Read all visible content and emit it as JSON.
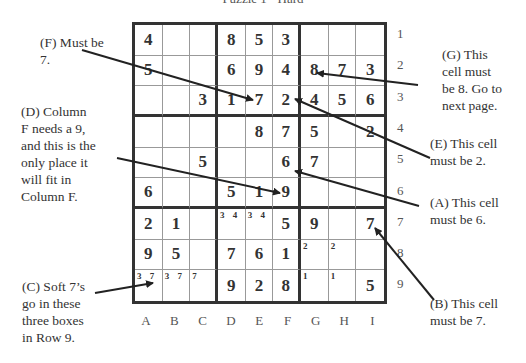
{
  "title": "Puzzle 1 - Hard",
  "grid": {
    "columns": [
      "A",
      "B",
      "C",
      "D",
      "E",
      "F",
      "G",
      "H",
      "I"
    ],
    "rows": [
      "1",
      "2",
      "3",
      "4",
      "5",
      "6",
      "7",
      "8",
      "9"
    ],
    "cells": [
      [
        "4",
        "",
        "",
        "8",
        "5",
        "3",
        "",
        "",
        ""
      ],
      [
        "5",
        "",
        "",
        "6",
        "9",
        "4",
        "8",
        "7",
        "3"
      ],
      [
        "",
        "",
        "3",
        "1",
        "7",
        "2",
        "4",
        "5",
        "6"
      ],
      [
        "",
        "",
        "",
        "",
        "8",
        "7",
        "5",
        "",
        "2"
      ],
      [
        "",
        "",
        "5",
        "",
        "",
        "6",
        "7",
        "",
        ""
      ],
      [
        "6",
        "",
        "",
        "5",
        "1",
        "9",
        "",
        "",
        ""
      ],
      [
        "2",
        "1",
        "",
        "",
        "",
        "5",
        "9",
        "",
        "7"
      ],
      [
        "9",
        "5",
        "",
        "7",
        "6",
        "1",
        "",
        "",
        ""
      ],
      [
        "",
        "",
        "",
        "9",
        "2",
        "8",
        "",
        "",
        "5"
      ]
    ],
    "candidates": [
      [
        "",
        "",
        "",
        "",
        "",
        "",
        "",
        "",
        ""
      ],
      [
        "",
        "",
        "",
        "",
        "",
        "",
        "",
        "",
        ""
      ],
      [
        "",
        "",
        "",
        "",
        "",
        "",
        "",
        "",
        ""
      ],
      [
        "",
        "",
        "",
        "",
        "",
        "",
        "",
        "",
        ""
      ],
      [
        "",
        "",
        "",
        "",
        "",
        "",
        "",
        "",
        ""
      ],
      [
        "",
        "",
        "",
        "",
        "",
        "",
        "",
        "",
        ""
      ],
      [
        "",
        "",
        "",
        "3 4",
        "3 4",
        "",
        "",
        "",
        ""
      ],
      [
        "",
        "",
        "",
        "",
        "",
        "",
        "2",
        "2",
        ""
      ],
      [
        "3 7",
        "3 7",
        "7",
        "",
        "",
        "",
        "1",
        "1",
        ""
      ]
    ]
  },
  "annotations": {
    "F": "(F) Must be 7.",
    "D": "(D) Column F needs a 9, and this is the only place it will fit in Column F.",
    "C": "(C) Soft 7’s go in these three boxes in Row 9.",
    "G": "(G) This cell must be 8. Go to next page.",
    "E": "(E) This cell must be 2.",
    "A": "(A) This cell must be 6.",
    "B": "(B) This cell must be 7."
  },
  "annotation_lines": {
    "F": [
      "(F) Must be",
      "7."
    ],
    "D": [
      "(D) Column",
      "F needs a 9,",
      "and this is the",
      "only place it",
      "will fit in",
      "Column F."
    ],
    "C": [
      "(C) Soft 7’s",
      "go in these",
      "three boxes",
      "in Row 9."
    ],
    "G": [
      "(G) This",
      "cell must",
      "be 8. Go to",
      "next page."
    ],
    "E": [
      "(E) This cell",
      "must be 2."
    ],
    "A": [
      "(A) This cell",
      "must be 6."
    ],
    "B": [
      "(B) This cell",
      "must be 7."
    ]
  },
  "colors": {
    "ink": "#333333",
    "grid_thin": "#999999",
    "label": "#555555"
  }
}
